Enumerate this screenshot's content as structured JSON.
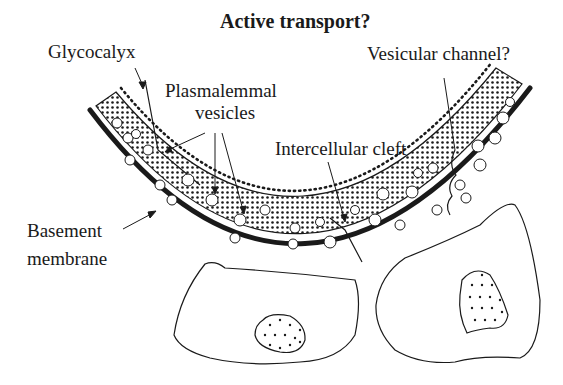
{
  "diagram": {
    "title": "Active transport?",
    "labels": {
      "glycocalyx": "Glycocalyx",
      "plasmalemmal_1": "Plasmalemmal",
      "plasmalemmal_2": "vesicles",
      "vesicular_channel": "Vesicular channel?",
      "intercellular_cleft": "Intercellular cleft",
      "basement_1": "Basement",
      "basement_2": "membrane"
    },
    "colors": {
      "ink": "#1a1a1a",
      "background": "#ffffff"
    }
  }
}
